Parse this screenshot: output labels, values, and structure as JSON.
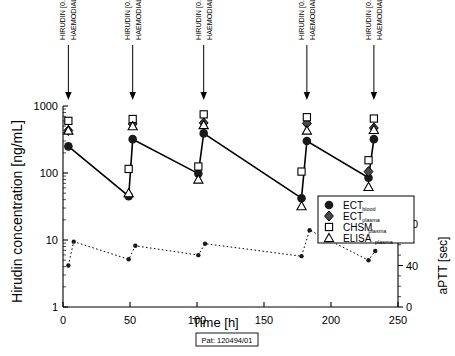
{
  "chart_data": {
    "type": "line",
    "title": "",
    "subtitle": "",
    "xlabel": "Time [h]",
    "ylabel": "Hirudin concentration [ng/mL]",
    "y2label": "aPTT [sec]",
    "xlim": [
      0,
      250
    ],
    "ylim": [
      1,
      1000
    ],
    "yscale": "log",
    "y2lim": [
      0,
      80
    ],
    "xticks": [
      0,
      50,
      100,
      150,
      200,
      250
    ],
    "xticklabels": [
      "0",
      "50",
      "100",
      "150",
      "200",
      "250"
    ],
    "yticks": [
      1,
      10,
      100,
      1000
    ],
    "yticklabels": [
      "1",
      "10",
      "100",
      "1000"
    ],
    "y2ticks": [
      0,
      40,
      80
    ],
    "y2ticklabels": [
      "0",
      "40",
      "80"
    ],
    "grid": false,
    "legend_position": "lower-right",
    "patient_label": "Pat: 120494/01",
    "series": [
      {
        "name": "ECT blood",
        "label_main": "ECT",
        "label_sub": "blood",
        "marker": "filled-circle",
        "connected": true,
        "x": [
          4,
          49,
          52,
          101,
          105,
          178,
          182,
          228,
          232
        ],
        "y": [
          250,
          45,
          320,
          98,
          390,
          42,
          300,
          85,
          320
        ]
      },
      {
        "name": "ECT plasma",
        "label_main": "ECT",
        "label_sub": "plasma",
        "marker": "filled-diamond",
        "connected": false,
        "x": [
          4,
          52,
          105,
          182,
          228,
          232
        ],
        "y": [
          430,
          540,
          560,
          550,
          105,
          470
        ]
      },
      {
        "name": "CHSM plasma",
        "label_main": "CHSM",
        "label_sub": "plasma",
        "marker": "open-square",
        "connected": false,
        "x": [
          4,
          49,
          52,
          101,
          105,
          178,
          182,
          228,
          232
        ],
        "y": [
          600,
          115,
          640,
          125,
          750,
          105,
          680,
          155,
          650
        ]
      },
      {
        "name": "ELISA plasma",
        "label_main": "ELISA",
        "label_sub": "plasma",
        "marker": "open-triangle",
        "connected": false,
        "x": [
          4,
          49,
          52,
          101,
          105,
          178,
          182,
          228,
          232
        ],
        "y": [
          430,
          50,
          500,
          80,
          520,
          32,
          430,
          62,
          440
        ]
      },
      {
        "name": "aPTT",
        "label_main": "aPTT",
        "label_sub": "",
        "marker": "small-filled-circle",
        "axis": "right",
        "connected": true,
        "linestyle": "dotted",
        "x": [
          4,
          8,
          49,
          54,
          101,
          106,
          178,
          184,
          228,
          233
        ],
        "y": [
          40,
          63,
          46,
          59,
          50,
          61,
          49,
          74,
          45,
          54
        ]
      }
    ],
    "annotations": [
      {
        "x": 4,
        "line1": "HIRUDIN [0.1 mg/kg]",
        "line2": "HAEMODIALYSIS"
      },
      {
        "x": 52,
        "line1": "HIRUDIN [0.1 mg/kg]",
        "line2": "HAEMODIALYSIS"
      },
      {
        "x": 105,
        "line1": "HIRUDIN [0.11 mg/kg]",
        "line2": "HAEMODIALYSIS"
      },
      {
        "x": 182,
        "line1": "HIRUDIN [0.11 mg/kg]",
        "line2": "HAEMODIALYSIS"
      },
      {
        "x": 232,
        "line1": "HIRUDIN [0.1 mg/kg]",
        "line2": "HAEMODIALYSIS"
      }
    ]
  },
  "colors": {
    "foreground": "#000000",
    "background": "#ffffff",
    "marker_fill": "#1a1a1a",
    "diamond_fill": "#4a4a4a"
  }
}
